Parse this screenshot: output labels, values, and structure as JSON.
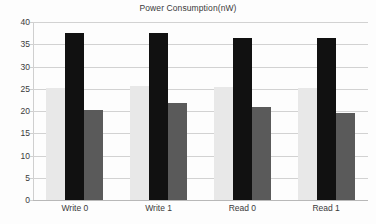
{
  "chart_data": {
    "type": "bar",
    "title": "Power Consumption(nW)",
    "xlabel": "",
    "ylabel": "",
    "ylim": [
      0,
      40
    ],
    "yticks": [
      0,
      5,
      10,
      15,
      20,
      25,
      30,
      35,
      40
    ],
    "grid": true,
    "legend": "none",
    "categories": [
      "Write 0",
      "Write 1",
      "Read 0",
      "Read 1"
    ],
    "series": [
      {
        "name": "series-1",
        "color": "#e8e8e8",
        "values": [
          25.1,
          25.7,
          25.5,
          25.1
        ]
      },
      {
        "name": "series-2",
        "color": "#111111",
        "values": [
          37.6,
          37.6,
          36.3,
          36.3
        ]
      },
      {
        "name": "series-3",
        "color": "#5a5a5a",
        "values": [
          20.2,
          21.9,
          20.8,
          19.6
        ]
      }
    ]
  },
  "axis": {
    "tick_labels": [
      "40",
      "35",
      "30",
      "25",
      "20",
      "15",
      "10",
      "5",
      "0"
    ]
  },
  "colors": {
    "background": "#fdfdfd",
    "gridline": "#d2d2d2",
    "axis": "#b8b8b8",
    "text": "#3a3a3a"
  }
}
